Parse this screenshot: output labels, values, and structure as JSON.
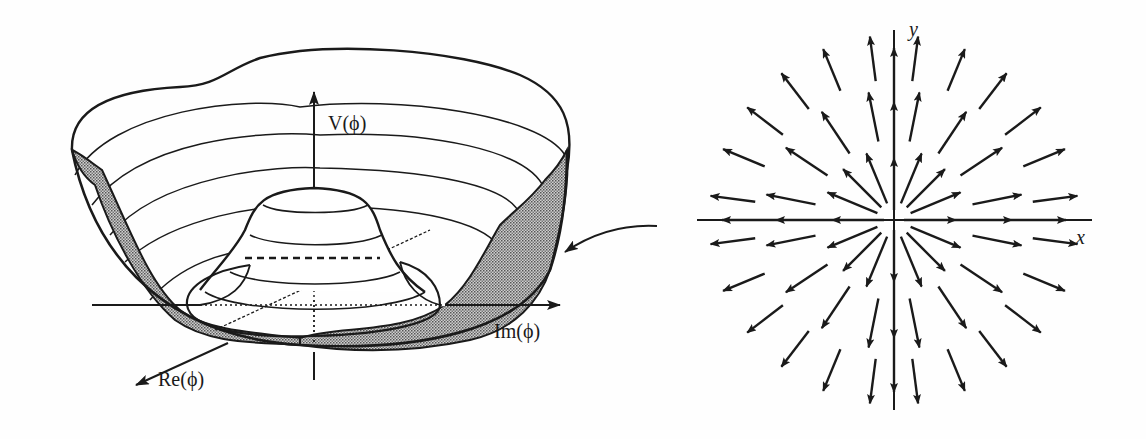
{
  "figure": {
    "left_panel": {
      "title": "Mexican hat potential",
      "axes": {
        "vertical_label": "V(ϕ)",
        "real_axis_label": "Re(ϕ)",
        "imag_axis_label": "Im(ϕ)"
      },
      "features": [
        "central hump",
        "circular valley of minima",
        "shaded cross-section of potential well",
        "dashed Re axis through hump"
      ]
    },
    "connector": {
      "type": "curved-arrow",
      "direction": "right-to-left"
    },
    "right_panel": {
      "title": "radial vector field",
      "axes": {
        "x_label": "x",
        "y_label": "y"
      },
      "pattern": "arrows pointing radially outward from origin"
    },
    "colors": {
      "ink": "#1a1a1a",
      "shading": "#9a9a9a",
      "background": "#fefefe",
      "ghost_text": "#e2e2e2"
    }
  }
}
